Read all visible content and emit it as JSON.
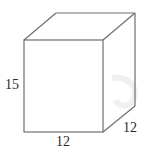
{
  "figure": {
    "type": "rectangular-prism",
    "projection": "oblique",
    "dimensions": {
      "height": "15",
      "width": "12",
      "depth": "12"
    },
    "labels": {
      "height_label": "15",
      "width_label": "12",
      "depth_label": "12"
    },
    "colors": {
      "edge": "#6e6e6e",
      "label": "#2a2a2a",
      "background": "#ffffff"
    }
  }
}
